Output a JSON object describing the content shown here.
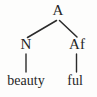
{
  "figure": {
    "type": "morphological-tree-diagram",
    "background_color": "#fdfdfc",
    "ink_color": "#262626",
    "width": 97,
    "height": 97
  },
  "tree": {
    "root": {
      "label": "A"
    },
    "children": [
      {
        "label": "N",
        "leaf": "beauty"
      },
      {
        "label": "Af",
        "leaf": "ful"
      }
    ]
  },
  "edges": [
    {
      "name": "root-to-left-branch",
      "from": "A",
      "to": "N"
    },
    {
      "name": "root-to-right-branch",
      "from": "A",
      "to": "Af"
    },
    {
      "name": "left-node-to-leaf",
      "from": "N",
      "to": "beauty"
    },
    {
      "name": "right-node-to-leaf",
      "from": "Af",
      "to": "ful"
    }
  ]
}
